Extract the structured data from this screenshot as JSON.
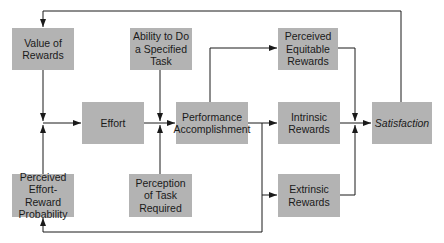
{
  "diagram": {
    "type": "flow",
    "boxes": {
      "value_of_rewards": "Value of Rewards",
      "ability": "Ability to Do a Specified Task",
      "perceived_equitable": "Perceived Equitable Rewards",
      "effort": "Effort",
      "performance": "Performance Accomplishment",
      "intrinsic": "Intrinsic Rewards",
      "satisfaction": "Satisfaction",
      "effort_reward_prob": "Perceived Effort-Reward Probability",
      "perception_task": "Perception of Task Required",
      "extrinsic": "Extrinsic Rewards"
    },
    "edges": [
      [
        "Value of Rewards",
        "Effort"
      ],
      [
        "Perceived Effort-Reward Probability",
        "Effort"
      ],
      [
        "Effort",
        "Performance Accomplishment"
      ],
      [
        "Ability to Do a Specified Task",
        "Performance Accomplishment"
      ],
      [
        "Perception of Task Required",
        "Performance Accomplishment"
      ],
      [
        "Performance Accomplishment",
        "Perceived Equitable Rewards"
      ],
      [
        "Performance Accomplishment",
        "Intrinsic Rewards"
      ],
      [
        "Performance Accomplishment",
        "Extrinsic Rewards"
      ],
      [
        "Performance Accomplishment",
        "Perceived Effort-Reward Probability"
      ],
      [
        "Perceived Equitable Rewards",
        "Satisfaction"
      ],
      [
        "Intrinsic Rewards",
        "Satisfaction"
      ],
      [
        "Extrinsic Rewards",
        "Satisfaction"
      ],
      [
        "Satisfaction",
        "Value of Rewards"
      ]
    ]
  }
}
